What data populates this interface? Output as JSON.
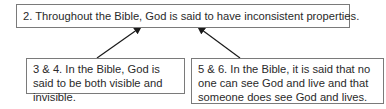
{
  "diagram": {
    "conclusion": {
      "label": "2. Throughout the Bible, God is said to have inconsistent properties."
    },
    "premises": [
      {
        "label": "3 & 4. In the Bible, God is said to be both visible and invisible."
      },
      {
        "label": "5 & 6. In the Bible, it is said that no one can see God and live and that someone does see God and lives."
      }
    ],
    "arrows": [
      {
        "from": "premise-1",
        "to": "conclusion"
      },
      {
        "from": "premise-2",
        "to": "conclusion"
      }
    ],
    "colors": {
      "border": "#7a7a7a",
      "arrow": "#1a1a1a",
      "text": "#2a2a2a"
    }
  }
}
